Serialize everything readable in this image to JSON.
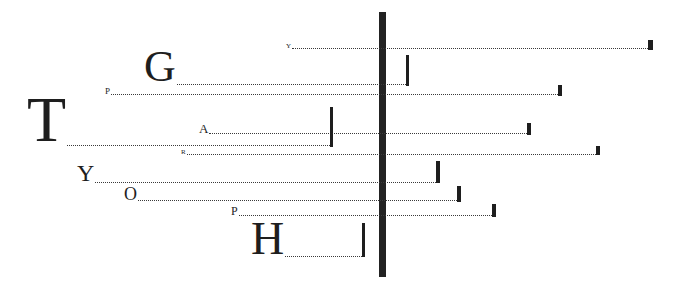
{
  "diagram": {
    "axis": {
      "x": 379,
      "width": 7,
      "top": 12,
      "bottom": 277,
      "color": "#222222"
    },
    "rows": [
      {
        "letter": "Y",
        "size": 7,
        "label_x": 286,
        "baseline": 49,
        "line_y": 48,
        "end_x": 648,
        "tick_w": 5,
        "tick_top": 40,
        "tick_bottom": 50
      },
      {
        "letter": "G",
        "size": 44,
        "label_x": 144,
        "baseline": 85,
        "line_y": 84,
        "end_x": 406,
        "tick_w": 3,
        "tick_top": 55,
        "tick_bottom": 86
      },
      {
        "letter": "P",
        "size": 9,
        "label_x": 105,
        "baseline": 95,
        "line_y": 94,
        "end_x": 558,
        "tick_w": 4,
        "tick_top": 85,
        "tick_bottom": 96
      },
      {
        "letter": "A",
        "size": 13,
        "label_x": 199,
        "baseline": 134,
        "line_y": 133,
        "end_x": 527,
        "tick_w": 4,
        "tick_top": 123,
        "tick_bottom": 135
      },
      {
        "letter": "T",
        "size": 64,
        "label_x": 27,
        "baseline": 146,
        "line_y": 145,
        "end_x": 330,
        "tick_w": 3,
        "tick_top": 107,
        "tick_bottom": 147
      },
      {
        "letter": "R",
        "size": 7,
        "label_x": 181,
        "baseline": 155,
        "line_y": 154,
        "end_x": 596,
        "tick_w": 4,
        "tick_top": 146,
        "tick_bottom": 155
      },
      {
        "letter": "Y",
        "size": 24,
        "label_x": 77,
        "baseline": 183,
        "line_y": 182,
        "end_x": 436,
        "tick_w": 4,
        "tick_top": 161,
        "tick_bottom": 183
      },
      {
        "letter": "O",
        "size": 18,
        "label_x": 124,
        "baseline": 201,
        "line_y": 200,
        "end_x": 457,
        "tick_w": 4,
        "tick_top": 186,
        "tick_bottom": 202
      },
      {
        "letter": "P",
        "size": 12,
        "label_x": 231,
        "baseline": 216,
        "line_y": 215,
        "end_x": 492,
        "tick_w": 4,
        "tick_top": 204,
        "tick_bottom": 217
      },
      {
        "letter": "H",
        "size": 46,
        "label_x": 251,
        "baseline": 257,
        "line_y": 256,
        "end_x": 362,
        "tick_w": 3,
        "tick_top": 223,
        "tick_bottom": 257
      }
    ]
  }
}
